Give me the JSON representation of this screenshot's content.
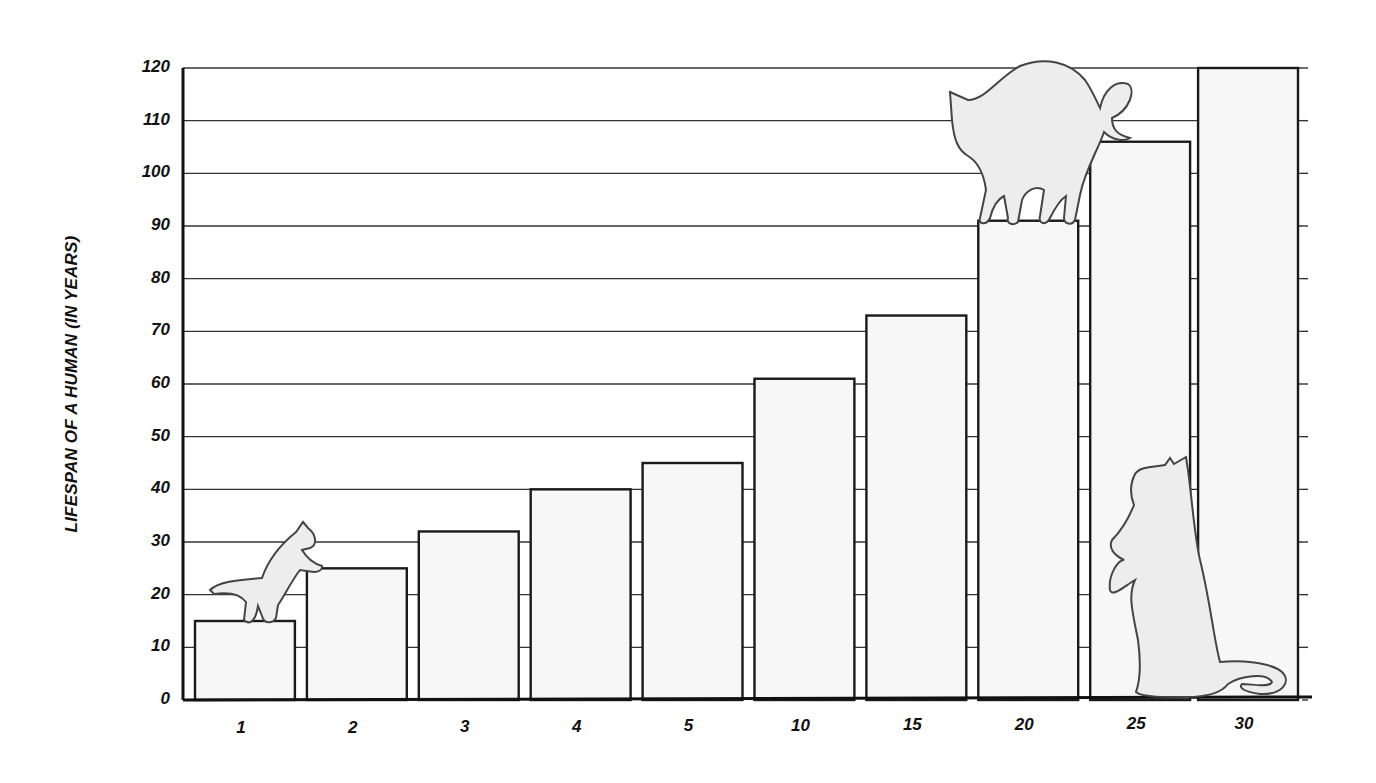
{
  "chart_data": {
    "type": "bar",
    "title": "",
    "xlabel": "",
    "ylabel": "LIFESPAN OF A HUMAN (IN YEARS)",
    "categories": [
      "1",
      "2",
      "3",
      "4",
      "5",
      "10",
      "15",
      "20",
      "25",
      "30"
    ],
    "values": [
      15,
      25,
      32,
      40,
      45,
      61,
      73,
      91,
      106,
      120
    ],
    "ylim": [
      0,
      120
    ],
    "yticks": [
      "0",
      "10",
      "20",
      "30",
      "40",
      "50",
      "60",
      "70",
      "80",
      "90",
      "100",
      "110",
      "120"
    ],
    "grid": true,
    "legend": null,
    "annotations": [
      "kitten climbing from bar 1 to bar 2",
      "arched cat standing on bar 20",
      "cat sitting upright beside bar 30"
    ]
  },
  "colors": {
    "bar_fill": "#f7f7f7",
    "bar_stroke": "#1a1a1a",
    "grid": "#333333",
    "cat_fill": "#ededed",
    "cat_stroke": "#444444"
  }
}
